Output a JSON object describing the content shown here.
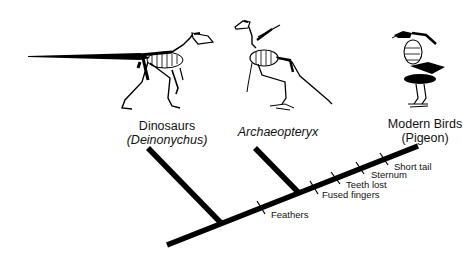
{
  "diagram": {
    "type": "cladogram",
    "taxa": [
      {
        "name": "Dinosaurs",
        "example": "(Deinonychus)",
        "icon": "deinonychus-skeleton-icon"
      },
      {
        "name": "Archaeopteryx",
        "icon": "archaeopteryx-skeleton-icon"
      },
      {
        "name": "Modern Birds",
        "example": "(Pigeon)",
        "icon": "pigeon-skeleton-icon"
      }
    ],
    "traits": [
      "Feathers",
      "Fused fingers",
      "Teeth lost",
      "Sternum",
      "Short tail"
    ],
    "colors": {
      "line": "#000000",
      "text": "#111111",
      "background": "#ffffff"
    }
  }
}
